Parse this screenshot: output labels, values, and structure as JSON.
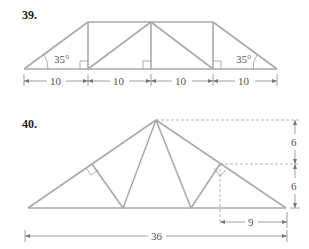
{
  "problems": [
    {
      "number": "39.",
      "angle_left": "35°",
      "angle_right": "35°",
      "segments": [
        "10",
        "10",
        "10",
        "10"
      ]
    },
    {
      "number": "40.",
      "height_top": "6",
      "height_bottom": "6",
      "offset": "9",
      "span": "36"
    }
  ],
  "colors": {
    "truss": "#aaaaaa",
    "dim": "#888888",
    "text": "#555555"
  }
}
